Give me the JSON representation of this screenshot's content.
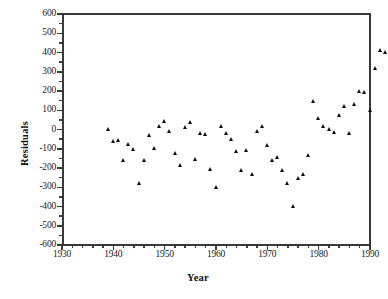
{
  "chart_data": {
    "type": "scatter",
    "title": "",
    "xlabel": "Year",
    "ylabel": "Residuals",
    "xlim": [
      1930,
      1990
    ],
    "ylim": [
      -600,
      600
    ],
    "xticks": [
      1930,
      1940,
      1950,
      1960,
      1970,
      1980,
      1990
    ],
    "yticks": [
      600,
      500,
      400,
      300,
      200,
      100,
      0,
      -100,
      -200,
      -300,
      -400,
      -500,
      -600
    ],
    "x_minor_step": 2,
    "y_minor_step": 50,
    "grid": false,
    "legend": null,
    "marker": "filled-triangle",
    "marker_color": "#0d0d0d",
    "frame": "box",
    "points": [
      {
        "x": 1939,
        "y": 0
      },
      {
        "x": 1940,
        "y": -60
      },
      {
        "x": 1941,
        "y": -55
      },
      {
        "x": 1942,
        "y": -160
      },
      {
        "x": 1943,
        "y": -75
      },
      {
        "x": 1944,
        "y": -100
      },
      {
        "x": 1945,
        "y": -280
      },
      {
        "x": 1946,
        "y": -160
      },
      {
        "x": 1947,
        "y": -30
      },
      {
        "x": 1948,
        "y": -95
      },
      {
        "x": 1949,
        "y": 20
      },
      {
        "x": 1950,
        "y": 45
      },
      {
        "x": 1951,
        "y": -10
      },
      {
        "x": 1952,
        "y": -125
      },
      {
        "x": 1953,
        "y": -185
      },
      {
        "x": 1954,
        "y": 10
      },
      {
        "x": 1955,
        "y": 40
      },
      {
        "x": 1956,
        "y": -155
      },
      {
        "x": 1957,
        "y": -20
      },
      {
        "x": 1958,
        "y": -25
      },
      {
        "x": 1959,
        "y": -205
      },
      {
        "x": 1960,
        "y": -300
      },
      {
        "x": 1961,
        "y": 20
      },
      {
        "x": 1962,
        "y": -20
      },
      {
        "x": 1963,
        "y": -50
      },
      {
        "x": 1964,
        "y": -110
      },
      {
        "x": 1965,
        "y": -210
      },
      {
        "x": 1966,
        "y": -105
      },
      {
        "x": 1967,
        "y": -230
      },
      {
        "x": 1968,
        "y": -10
      },
      {
        "x": 1969,
        "y": 20
      },
      {
        "x": 1970,
        "y": -80
      },
      {
        "x": 1971,
        "y": -160
      },
      {
        "x": 1972,
        "y": -145
      },
      {
        "x": 1973,
        "y": -210
      },
      {
        "x": 1974,
        "y": -280
      },
      {
        "x": 1975,
        "y": -400
      },
      {
        "x": 1976,
        "y": -250
      },
      {
        "x": 1977,
        "y": -230
      },
      {
        "x": 1978,
        "y": -135
      },
      {
        "x": 1979,
        "y": 150
      },
      {
        "x": 1980,
        "y": 60
      },
      {
        "x": 1981,
        "y": 20
      },
      {
        "x": 1982,
        "y": 0
      },
      {
        "x": 1983,
        "y": -15
      },
      {
        "x": 1984,
        "y": 75
      },
      {
        "x": 1985,
        "y": 120
      },
      {
        "x": 1986,
        "y": -20
      },
      {
        "x": 1987,
        "y": 130
      },
      {
        "x": 1988,
        "y": 200
      },
      {
        "x": 1989,
        "y": 195
      },
      {
        "x": 1990,
        "y": 100
      },
      {
        "x": 1991,
        "y": 320
      },
      {
        "x": 1992,
        "y": 410
      },
      {
        "x": 1993,
        "y": 400
      },
      {
        "x": 1994,
        "y": 580
      },
      {
        "x": 1995,
        "y": 500
      },
      {
        "x": 1996,
        "y": 490
      },
      {
        "x": 1997,
        "y": 290
      }
    ]
  }
}
